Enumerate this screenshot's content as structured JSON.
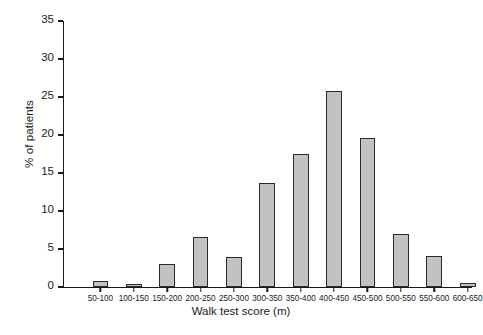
{
  "chart_data": {
    "type": "bar",
    "title": "",
    "subtitle": "",
    "xlabel": "Walk test score (m)",
    "ylabel": "% of patients",
    "categories": [
      "50-100",
      "100-150",
      "150-200",
      "200-250",
      "250-300",
      "300-350",
      "350-400",
      "400-450",
      "450-500",
      "500-550",
      "550-600",
      "600-650"
    ],
    "values": [
      0.8,
      0.4,
      3.0,
      6.6,
      4.0,
      13.7,
      17.5,
      25.8,
      19.6,
      7.0,
      4.1,
      0.5
    ],
    "ylim": [
      0,
      35
    ],
    "ytick_values": [
      0,
      5,
      10,
      15,
      20,
      25,
      30,
      35
    ],
    "ytick_labels": [
      "0",
      "5",
      "10",
      "15",
      "20",
      "25",
      "30",
      "35"
    ],
    "grid": false,
    "legend": "none",
    "bar_fill_color": "#c2c2c2",
    "bar_edge_color": "#2b2b2b",
    "axis_color": "#1a1a1a",
    "background_color": "#ffffff"
  }
}
